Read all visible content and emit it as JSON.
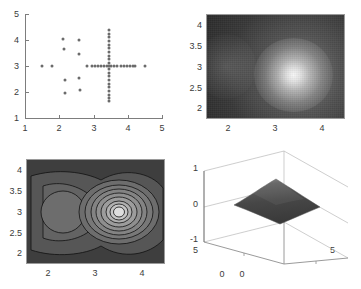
{
  "figure": {
    "title": "",
    "background": "#ffffff",
    "layout": "2x2 subplot grid",
    "panel_count": 4
  },
  "chart_data": [
    {
      "id": "scatter-samples",
      "type": "scatter",
      "title": "",
      "xlabel": "",
      "ylabel": "",
      "xlim": [
        1,
        5
      ],
      "ylim": [
        1,
        5
      ],
      "xticks": [
        1,
        2,
        3,
        4,
        5
      ],
      "yticks": [
        1,
        2,
        3,
        4,
        5
      ],
      "xticklabels": [
        "1",
        "2",
        "3",
        "4",
        "5"
      ],
      "yticklabels": [
        "1",
        "2",
        "3",
        "4",
        "5"
      ],
      "grid": false,
      "legend": "none",
      "marker": "filled-circle",
      "marker_color": "#6b6b6b",
      "points": [
        [
          1.5,
          3.0
        ],
        [
          1.78,
          3.0
        ],
        [
          2.12,
          4.02
        ],
        [
          2.15,
          3.66
        ],
        [
          2.17,
          2.45
        ],
        [
          2.18,
          1.98
        ],
        [
          2.57,
          4.0
        ],
        [
          2.58,
          3.48
        ],
        [
          2.58,
          2.55
        ],
        [
          2.6,
          2.08
        ],
        [
          2.8,
          3.0
        ],
        [
          2.95,
          3.0
        ],
        [
          3.05,
          3.0
        ],
        [
          3.14,
          3.0
        ],
        [
          3.22,
          3.0
        ],
        [
          3.3,
          3.0
        ],
        [
          3.38,
          3.0
        ],
        [
          3.45,
          3.0
        ],
        [
          3.52,
          3.0
        ],
        [
          3.6,
          3.0
        ],
        [
          3.7,
          3.0
        ],
        [
          3.8,
          3.0
        ],
        [
          3.9,
          3.0
        ],
        [
          3.98,
          3.0
        ],
        [
          4.06,
          3.0
        ],
        [
          4.14,
          3.0
        ],
        [
          4.22,
          3.0
        ],
        [
          4.5,
          3.0
        ],
        [
          3.45,
          4.38
        ],
        [
          3.45,
          4.24
        ],
        [
          3.45,
          4.1
        ],
        [
          3.45,
          3.96
        ],
        [
          3.45,
          3.82
        ],
        [
          3.45,
          3.68
        ],
        [
          3.45,
          3.54
        ],
        [
          3.45,
          3.4
        ],
        [
          3.45,
          3.26
        ],
        [
          3.45,
          3.12
        ],
        [
          3.45,
          2.88
        ],
        [
          3.45,
          2.74
        ],
        [
          3.45,
          2.6
        ],
        [
          3.45,
          2.46
        ],
        [
          3.45,
          2.32
        ],
        [
          3.45,
          2.18
        ],
        [
          3.45,
          2.04
        ],
        [
          3.45,
          1.9
        ],
        [
          3.45,
          1.76
        ],
        [
          3.45,
          1.64
        ]
      ]
    },
    {
      "id": "density-heatmap",
      "type": "heatmap",
      "title": "",
      "xlabel": "",
      "ylabel": "",
      "xlim": [
        1.55,
        4.45
      ],
      "ylim": [
        1.7,
        4.25
      ],
      "xticks": [
        2,
        3,
        4
      ],
      "yticks": [
        2,
        2.5,
        3,
        3.5,
        4
      ],
      "xticklabels": [
        "2",
        "3",
        "4"
      ],
      "yticklabels": [
        "2",
        "2.5",
        "3",
        "3.5",
        "4"
      ],
      "colormap": "gray",
      "peak": [
        3.5,
        3.05
      ],
      "peak_value": 1.0,
      "background_value": 0.18,
      "grid": false,
      "legend": "none"
    },
    {
      "id": "contour-map",
      "type": "heatmap",
      "render": "filled-contour",
      "title": "",
      "xlabel": "",
      "ylabel": "",
      "xlim": [
        1.55,
        4.45
      ],
      "ylim": [
        1.7,
        4.25
      ],
      "xticks": [
        2,
        3,
        4
      ],
      "yticks": [
        2,
        2.5,
        3,
        3.5,
        4
      ],
      "xticklabels": [
        "2",
        "3",
        "4"
      ],
      "yticklabels": [
        "2",
        "2.5",
        "3",
        "3.5",
        "4"
      ],
      "colormap": "gray",
      "contour_levels": 9,
      "primary_peak": [
        3.48,
        3.02
      ],
      "secondary_peak": [
        2.0,
        3.05
      ],
      "grid": false,
      "legend": "none"
    },
    {
      "id": "surface-3d",
      "type": "surface",
      "title": "",
      "xlabel": "",
      "ylabel": "",
      "zlabel": "",
      "xlim": [
        0,
        5
      ],
      "ylim": [
        0,
        5
      ],
      "zlim": [
        -1,
        1
      ],
      "zticks": [
        -1,
        0,
        1
      ],
      "zticklabels": [
        "1",
        "0",
        "-1"
      ],
      "x_corner_label": "0",
      "y_corner_label": "0",
      "x_far_label": "5",
      "y_far_label": "5",
      "grid": true,
      "legend": "none",
      "surface_color": "#4a4a4a",
      "shape": "central peak with saddle edges"
    }
  ],
  "panels": {
    "scatter": {
      "xticklabels": [
        "1",
        "2",
        "3",
        "4",
        "5"
      ],
      "yticklabels": [
        "1",
        "2",
        "3",
        "4",
        "5"
      ]
    },
    "heatmap": {
      "xticklabels": [
        "2",
        "3",
        "4"
      ],
      "yticklabels": [
        "4",
        "3.5",
        "3",
        "2.5",
        "2"
      ]
    },
    "contour": {
      "xticklabels": [
        "2",
        "3",
        "4"
      ],
      "yticklabels": [
        "4",
        "3.5",
        "3",
        "2.5",
        "2"
      ]
    },
    "surface": {
      "zticklabels": [
        "1",
        "0",
        "-1"
      ],
      "corner_left": "5",
      "corner_bottom_left": "0",
      "corner_bottom_right": "0",
      "corner_right": "5"
    }
  }
}
